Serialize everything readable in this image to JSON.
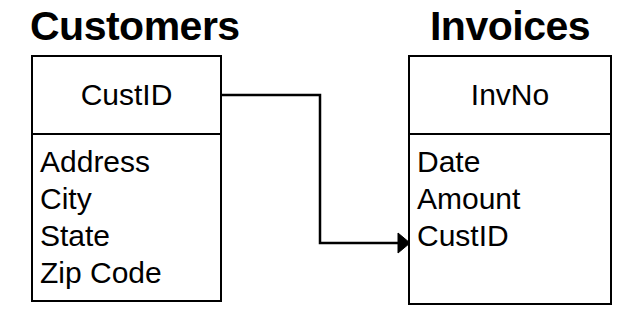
{
  "diagram": {
    "type": "entity-relationship-diagram",
    "background_color": "#ffffff",
    "line_color": "#000000",
    "entities": [
      {
        "name": "Customers",
        "primary_key": "CustID",
        "attributes": [
          "Address",
          "City",
          "State",
          "Zip Code"
        ]
      },
      {
        "name": "Invoices",
        "primary_key": "InvNo",
        "attributes": [
          "Date",
          "Amount",
          "CustID"
        ]
      }
    ],
    "relationship": {
      "from_entity": "Customers",
      "from_field": "CustID",
      "to_entity": "Invoices",
      "to_field": "CustID",
      "arrow_head": "filled-triangle",
      "arrow_direction": "right",
      "routing": "orthogonal"
    }
  }
}
